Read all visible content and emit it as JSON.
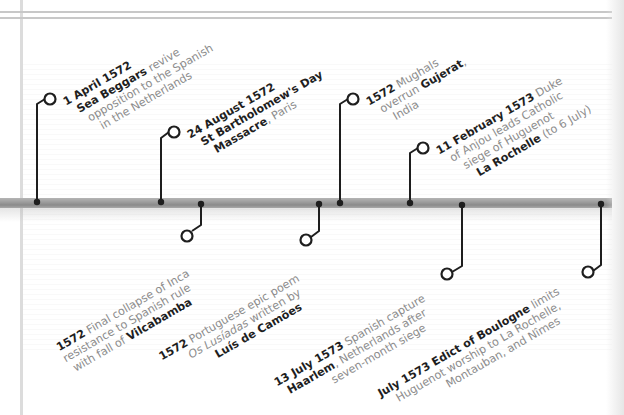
{
  "timeline": {
    "colors": {
      "connector": "#1e1e1e",
      "bar": "#9a9a9a",
      "body_text": "#8c8c8c",
      "bold_text": "#1e1e1e"
    },
    "events_above": [
      {
        "id": "sea-beggars",
        "date": "1 April 1572",
        "lines": [
          "",
          "Sea Beggars",
          " revive",
          "opposition to the Spanish",
          "in the Netherlands"
        ],
        "bar_x": 37,
        "circle": [
          50,
          99
        ]
      },
      {
        "id": "st-bartholomew",
        "date": "24 August 1572",
        "lines": [
          "St Bartholomew's Day",
          "Massacre",
          ", Paris"
        ],
        "bar_x": 161,
        "circle": [
          174,
          132
        ]
      },
      {
        "id": "mughals-gujerat",
        "date": "1572",
        "lines": [
          " Mughals",
          "overrun ",
          "Gujerat",
          ",",
          "India"
        ],
        "bar_x": 340,
        "circle": [
          353,
          99
        ]
      },
      {
        "id": "la-rochelle",
        "date": "11 February 1573",
        "lines": [
          " Duke",
          "of Anjou leads Catholic",
          "siege of Huguenot",
          "La Rochelle",
          " (to 6 July)"
        ],
        "bar_x": 410,
        "circle": [
          423,
          148
        ]
      }
    ],
    "events_below": [
      {
        "id": "vilcabamba",
        "date": "1572",
        "lines": [
          " Final collapse of Inca",
          "resistance to Spanish rule",
          "with fall of ",
          "Vilcabamba"
        ],
        "bar_x": 201,
        "circle": [
          187,
          232
        ]
      },
      {
        "id": "lusiadas",
        "date": "1572",
        "lines": [
          " Portuguese epic poem",
          "Os Lusíadas",
          " written by",
          "Luís de Camões"
        ],
        "bar_x": 319,
        "circle": [
          306,
          238
        ]
      },
      {
        "id": "haarlem",
        "date": "13 July 1573",
        "lines": [
          " Spanish capture",
          "Haarlem",
          ", Netherlands after",
          "seven-month siege"
        ],
        "bar_x": 462,
        "circle": [
          447,
          273
        ]
      },
      {
        "id": "boulogne",
        "date": "July 1573",
        "lines": [
          " Edict of Boulogne",
          " limits",
          "Huguenot worship to La Rochelle,",
          "Montauban, and Nîmes"
        ],
        "bar_x": 601,
        "circle": [
          588,
          272
        ]
      }
    ]
  }
}
